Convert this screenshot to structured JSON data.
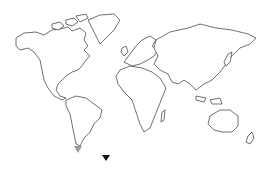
{
  "map": {
    "type": "world-outline",
    "background": "#ffffff",
    "stroke_color": "#333333"
  },
  "markers": [
    {
      "name": "south-america-tip-marker",
      "shape": "triangle-down",
      "color": "#999999",
      "x": 78,
      "y": 147
    },
    {
      "name": "ocean-marker",
      "shape": "triangle-down",
      "color": "#111111",
      "x": 106,
      "y": 158
    }
  ]
}
